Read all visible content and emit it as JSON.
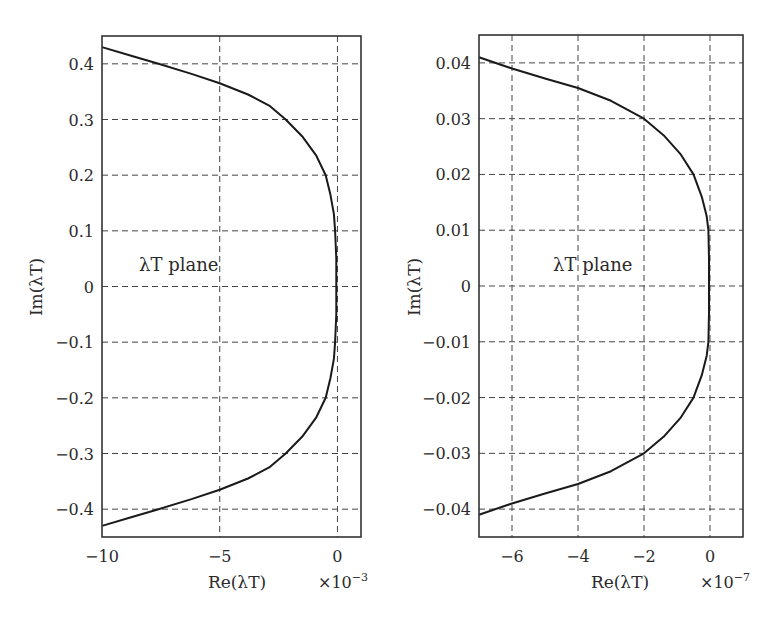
{
  "chart_data": [
    {
      "type": "line",
      "title": "",
      "xlabel": "Re(λT)",
      "ylabel": "Im(λT)",
      "x_multiplier": "×10⁻³",
      "annotation": "λT plane",
      "xlim": [
        -10,
        1
      ],
      "ylim": [
        -0.45,
        0.45
      ],
      "grid": true,
      "legend": null,
      "xticks": [
        -10,
        -5,
        0
      ],
      "xtick_labels": [
        "−10",
        "−5",
        "0"
      ],
      "xgrid": [
        -5,
        0
      ],
      "yticks": [
        0.4,
        0.3,
        0.2,
        0.1,
        0,
        -0.1,
        -0.2,
        -0.3,
        -0.4
      ],
      "ytick_labels": [
        "0.4",
        "0.3",
        "0.2",
        "0.1",
        "0",
        "−0.1",
        "−0.2",
        "−0.3",
        "−0.4"
      ],
      "series": [
        {
          "name": "eigenvalue locus",
          "x": [
            -10,
            -8.8,
            -7.6,
            -6.2,
            -5,
            -3.8,
            -2.9,
            -2.2,
            -1.5,
            -0.9,
            -0.5,
            -0.3,
            -0.15,
            -0.1,
            -0.05,
            -0.05,
            -0.05,
            -0.1,
            -0.15,
            -0.3,
            -0.5,
            -0.9,
            -1.5,
            -2.2,
            -2.9,
            -3.8,
            -5,
            -6.2,
            -7.6,
            -8.8,
            -10
          ],
          "y": [
            0.43,
            0.415,
            0.4,
            0.382,
            0.365,
            0.345,
            0.325,
            0.3,
            0.27,
            0.235,
            0.2,
            0.165,
            0.13,
            0.1,
            0.05,
            0,
            -0.05,
            -0.1,
            -0.13,
            -0.165,
            -0.2,
            -0.235,
            -0.27,
            -0.3,
            -0.325,
            -0.345,
            -0.365,
            -0.382,
            -0.4,
            -0.415,
            -0.43
          ]
        }
      ]
    },
    {
      "type": "line",
      "title": "",
      "xlabel": "Re(λT)",
      "ylabel": "Im(λT)",
      "x_multiplier": "×10⁻⁷",
      "annotation": "λT plane",
      "xlim": [
        -7,
        1
      ],
      "ylim": [
        -0.045,
        0.045
      ],
      "grid": true,
      "legend": null,
      "xticks": [
        -6,
        -4,
        -2,
        0
      ],
      "xtick_labels": [
        "−6",
        "−4",
        "−2",
        "0"
      ],
      "xgrid": [
        -6,
        -4,
        -2,
        0
      ],
      "yticks": [
        0.04,
        0.03,
        0.02,
        0.01,
        0,
        -0.01,
        -0.02,
        -0.03,
        -0.04
      ],
      "ytick_labels": [
        "0.04",
        "0.03",
        "0.02",
        "0.01",
        "0",
        "−0.01",
        "−0.02",
        "−0.03",
        "−0.04"
      ],
      "series": [
        {
          "name": "eigenvalue locus",
          "x": [
            -7,
            -6,
            -5,
            -4,
            -3,
            -2,
            -1.4,
            -0.9,
            -0.5,
            -0.25,
            -0.1,
            -0.05,
            -0.03,
            -0.03,
            -0.03,
            -0.05,
            -0.1,
            -0.25,
            -0.5,
            -0.9,
            -1.4,
            -2,
            -3,
            -4,
            -5,
            -6,
            -7
          ],
          "y": [
            0.041,
            0.039,
            0.0372,
            0.0355,
            0.0332,
            0.03,
            0.027,
            0.0237,
            0.02,
            0.016,
            0.0125,
            0.01,
            0.005,
            0,
            -0.005,
            -0.01,
            -0.0125,
            -0.016,
            -0.02,
            -0.0237,
            -0.027,
            -0.03,
            -0.0332,
            -0.0355,
            -0.0372,
            -0.039,
            -0.041
          ]
        }
      ]
    }
  ],
  "plots": [
    {
      "xlabel": "Re(λT)",
      "ylabel": "Im(λT)",
      "x_multiplier_base": "×10",
      "x_multiplier_exp": "−3",
      "annotation": "λT plane"
    },
    {
      "xlabel": "Re(λT)",
      "ylabel": "Im(λT)",
      "x_multiplier_base": "×10",
      "x_multiplier_exp": "−7",
      "annotation": "λT plane"
    }
  ]
}
